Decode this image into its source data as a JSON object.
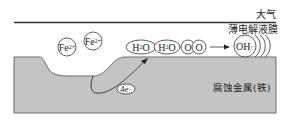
{
  "diagram": {
    "type": "electrochemical-corrosion-schematic",
    "labels": {
      "atmosphere": "大气",
      "electrolyte_film": "薄电解液膜",
      "metal": "腐蚀金属(铁)"
    },
    "ions": [
      {
        "id": "fe1",
        "base": "Fe",
        "sup": "2+",
        "sub": ""
      },
      {
        "id": "fe2",
        "base": "Fe",
        "sup": "2+",
        "sub": ""
      }
    ],
    "molecules": [
      {
        "id": "h2o-1",
        "pre": "H",
        "sub": "2",
        "post": "O"
      },
      {
        "id": "h2o-2",
        "pre": "H",
        "sub": "2",
        "post": "O"
      },
      {
        "id": "o-1",
        "text": "O"
      },
      {
        "id": "o-2",
        "text": "O"
      }
    ],
    "product": {
      "base": "OH",
      "sup": "−"
    },
    "electrons": {
      "text": "4e",
      "sup": "−"
    },
    "colors": {
      "metal_fill": "#c4c4c4",
      "metal_edge": "#6a6a6a",
      "line": "#333333",
      "text": "#222222"
    }
  }
}
